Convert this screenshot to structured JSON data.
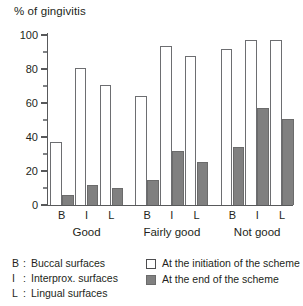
{
  "chart_data": {
    "type": "bar",
    "title": "% of gingivitis",
    "xlabel": "",
    "ylabel": "% of gingivitis",
    "ylim": [
      0,
      100
    ],
    "yticks": [
      0,
      20,
      40,
      60,
      80,
      100
    ],
    "ytick_labels": [
      "0",
      "20",
      "40",
      "60",
      "80",
      "100"
    ],
    "minor_yticks": [
      10,
      30,
      50,
      70,
      90
    ],
    "grid": false,
    "legend_position": "bottom-right",
    "groups": [
      "Good",
      "Fairly good",
      "Not good"
    ],
    "categories": [
      "B",
      "I",
      "L",
      "B",
      "I",
      "L",
      "B",
      "I",
      "L"
    ],
    "series": [
      {
        "name": "At the initiation of the scheme",
        "color": "#ffffff",
        "edge_color": "#6d6e71",
        "values": [
          37,
          80.5,
          70.5,
          64,
          93.5,
          87.5,
          92,
          97,
          97
        ]
      },
      {
        "name": "At the end of the scheme",
        "color": "#808080",
        "edge_color": "#6b6b6b",
        "values": [
          6,
          12,
          10,
          15,
          32,
          25.5,
          34,
          57,
          50.5
        ]
      }
    ],
    "annotations": []
  },
  "title": "% of gingivitis",
  "axis": {
    "y_tick_labels": [
      "100",
      "80",
      "60",
      "40",
      "20",
      "0"
    ]
  },
  "xaxis": {
    "ticks": [
      {
        "label": "B"
      },
      {
        "label": "I"
      },
      {
        "label": "L"
      },
      {
        "label": "B"
      },
      {
        "label": "I"
      },
      {
        "label": "L"
      },
      {
        "label": "B"
      },
      {
        "label": "I"
      },
      {
        "label": "L"
      }
    ],
    "groups": [
      {
        "label": "Good"
      },
      {
        "label": "Fairly good"
      },
      {
        "label": "Not good"
      }
    ]
  },
  "legend": {
    "keys": [
      {
        "abbr": "B",
        "colon": ":",
        "text": "Buccal surfaces"
      },
      {
        "abbr": "I",
        "colon": ":",
        "text": "Interprox. surfaces"
      },
      {
        "abbr": "L",
        "colon": ":",
        "text": "Lingual surfaces"
      }
    ],
    "series": [
      {
        "swatch": "open-square",
        "text": "At the initiation of the scheme"
      },
      {
        "swatch": "filled-square",
        "text": "At the end of the scheme"
      }
    ]
  },
  "colors": {
    "bar_open_fill": "#ffffff",
    "bar_open_edge": "#6d6e71",
    "bar_filled_fill": "#808080",
    "axis": "#58595b",
    "text": "#231f20"
  }
}
